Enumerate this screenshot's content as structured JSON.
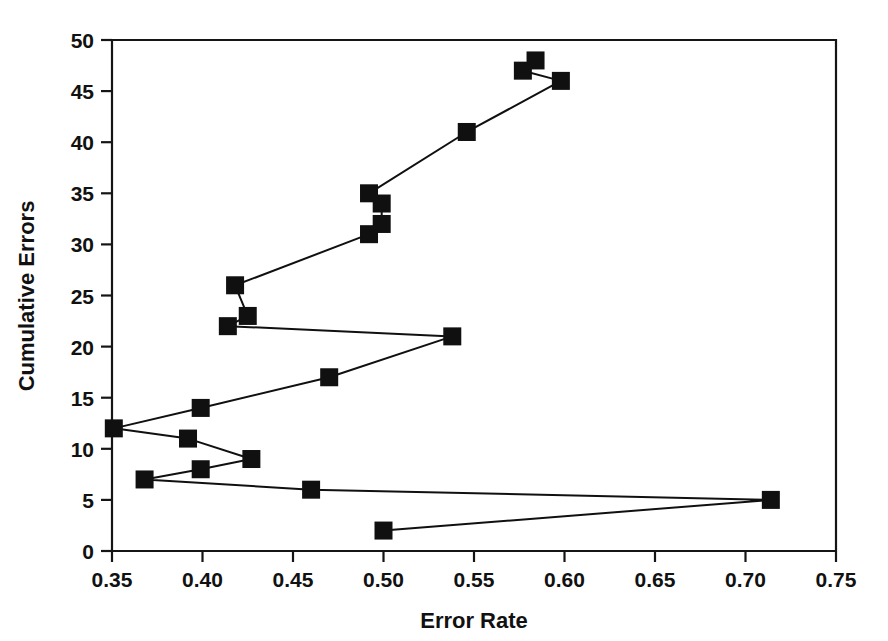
{
  "chart_data": {
    "type": "scatter",
    "title": "",
    "xlabel": "Error Rate",
    "ylabel": "Cumulative Errors",
    "xlim": [
      0.35,
      0.75
    ],
    "ylim": [
      0,
      50
    ],
    "xticks": [
      0.35,
      0.4,
      0.45,
      0.5,
      0.55,
      0.6,
      0.65,
      0.7,
      0.75
    ],
    "xtick_labels": [
      "0.35",
      "0.40",
      "0.45",
      "0.50",
      "0.55",
      "0.60",
      "0.65",
      "0.70",
      "0.75"
    ],
    "yticks": [
      0,
      5,
      10,
      15,
      20,
      25,
      30,
      35,
      40,
      45,
      50
    ],
    "ytick_labels": [
      "0",
      "5",
      "10",
      "15",
      "20",
      "25",
      "30",
      "35",
      "40",
      "45",
      "50"
    ],
    "grid": false,
    "legend": false,
    "marker": "filled-square",
    "marker_color": "#101010",
    "line_color": "#101010",
    "connected": true,
    "series": [
      {
        "name": "Cumulative Errors vs Error Rate",
        "points": [
          {
            "x": 0.5,
            "y": 2
          },
          {
            "x": 0.714,
            "y": 5
          },
          {
            "x": 0.46,
            "y": 6
          },
          {
            "x": 0.368,
            "y": 7
          },
          {
            "x": 0.399,
            "y": 8
          },
          {
            "x": 0.427,
            "y": 9
          },
          {
            "x": 0.392,
            "y": 11
          },
          {
            "x": 0.351,
            "y": 12
          },
          {
            "x": 0.399,
            "y": 14
          },
          {
            "x": 0.47,
            "y": 17
          },
          {
            "x": 0.538,
            "y": 21
          },
          {
            "x": 0.414,
            "y": 22
          },
          {
            "x": 0.425,
            "y": 23
          },
          {
            "x": 0.418,
            "y": 26
          },
          {
            "x": 0.492,
            "y": 31
          },
          {
            "x": 0.499,
            "y": 32
          },
          {
            "x": 0.499,
            "y": 34
          },
          {
            "x": 0.492,
            "y": 35
          },
          {
            "x": 0.546,
            "y": 41
          },
          {
            "x": 0.598,
            "y": 46
          },
          {
            "x": 0.577,
            "y": 47
          },
          {
            "x": 0.584,
            "y": 48
          }
        ]
      }
    ]
  }
}
